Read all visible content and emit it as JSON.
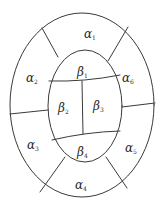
{
  "diagram": {
    "type": "nested-oval-partition",
    "outer_ring": {
      "name": "alpha",
      "regions": [
        {
          "id": "alpha1",
          "symbol": "α",
          "sub": "1",
          "x": 84,
          "y": 38
        },
        {
          "id": "alpha2",
          "symbol": "α",
          "sub": "2",
          "x": 26,
          "y": 82
        },
        {
          "id": "alpha3",
          "symbol": "α",
          "sub": "3",
          "x": 27,
          "y": 149
        },
        {
          "id": "alpha4",
          "symbol": "α",
          "sub": "4",
          "x": 75,
          "y": 189
        },
        {
          "id": "alpha5",
          "symbol": "α",
          "sub": "5",
          "x": 125,
          "y": 152
        },
        {
          "id": "alpha6",
          "symbol": "α",
          "sub": "6",
          "x": 122,
          "y": 82
        }
      ]
    },
    "inner_oval": {
      "name": "beta",
      "regions": [
        {
          "id": "beta1",
          "symbol": "β",
          "sub": "1",
          "x": 77,
          "y": 76
        },
        {
          "id": "beta2",
          "symbol": "β",
          "sub": "2",
          "x": 58,
          "y": 112
        },
        {
          "id": "beta3",
          "symbol": "β",
          "sub": "3",
          "x": 93,
          "y": 110
        },
        {
          "id": "beta4",
          "symbol": "β",
          "sub": "4",
          "x": 77,
          "y": 156
        }
      ]
    },
    "colors": {
      "line": "#3a3a3a",
      "text": "#2a2a2a",
      "background": "#ffffff"
    }
  }
}
